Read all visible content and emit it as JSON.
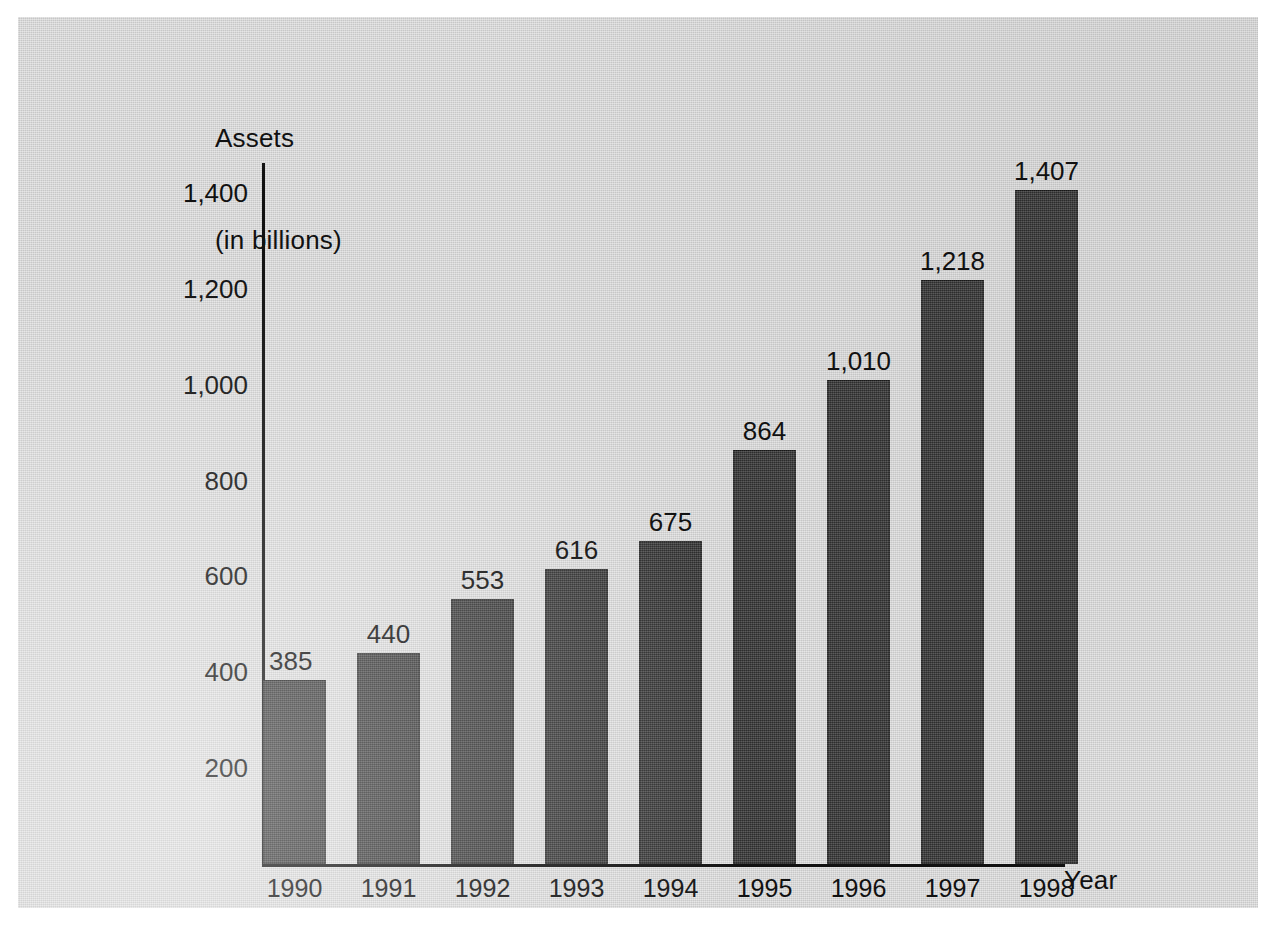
{
  "figure": {
    "background_color": "#d5d5d5",
    "page_color": "#ffffff",
    "bar_color": "#3c3c3c",
    "text_color": "#111111"
  },
  "chart_data": {
    "type": "bar",
    "title": "",
    "subtitle": "",
    "ylabel_line1": "Assets",
    "ylabel_line2": "(in billions)",
    "ylabel": "Assets (in billions)",
    "xlabel": "Year",
    "categories": [
      "1990",
      "1991",
      "1992",
      "1993",
      "1994",
      "1995",
      "1996",
      "1997",
      "1998"
    ],
    "values": [
      385,
      440,
      553,
      616,
      675,
      864,
      1010,
      1218,
      1407
    ],
    "value_labels": [
      "385",
      "440",
      "553",
      "616",
      "675",
      "864",
      "1,010",
      "1,218",
      "1,407"
    ],
    "ytick_values": [
      200,
      400,
      600,
      800,
      1000,
      1200,
      1400
    ],
    "ytick_labels": [
      "200",
      "400",
      "600",
      "800",
      "1,000",
      "1,200",
      "1,400"
    ],
    "ylim": [
      0,
      1500
    ],
    "grid": false,
    "legend": false,
    "legend_position": "none",
    "series": [
      {
        "name": "Assets",
        "values": [
          385,
          440,
          553,
          616,
          675,
          864,
          1010,
          1218,
          1407
        ]
      }
    ]
  }
}
